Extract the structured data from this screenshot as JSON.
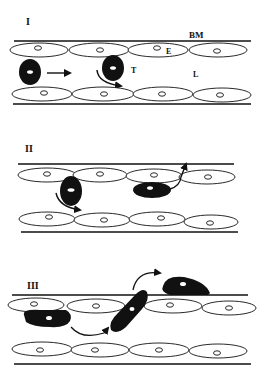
{
  "figure": {
    "colors": {
      "ink": "#111111",
      "background": "#ffffff",
      "cell_fill": "#ffffff"
    }
  },
  "panels": [
    {
      "id": "I",
      "label": "I",
      "annotations": {
        "basement_membrane": "BM",
        "endothelium": "E",
        "t_cell": "T",
        "lumen": "L"
      },
      "description": "Free-flowing T cell and rolling T cell in lumen"
    },
    {
      "id": "II",
      "label": "II",
      "description": "Adhesion and spreading on endothelium, probing junction"
    },
    {
      "id": "III",
      "label": "III",
      "description": "Crawling, transmigration through endothelial junction, and beneath basement membrane"
    }
  ]
}
